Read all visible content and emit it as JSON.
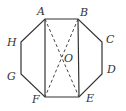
{
  "diagram": {
    "type": "geometry",
    "stroke_color": "#333333",
    "background": "#ffffff",
    "points": {
      "A": {
        "label": "A",
        "x": 45,
        "y": 19
      },
      "B": {
        "label": "B",
        "x": 78,
        "y": 19
      },
      "C": {
        "label": "C",
        "x": 102,
        "y": 42
      },
      "D": {
        "label": "D",
        "x": 102,
        "y": 74
      },
      "E": {
        "label": "E",
        "x": 79,
        "y": 97
      },
      "F": {
        "label": "F",
        "x": 45,
        "y": 97
      },
      "G": {
        "label": "G",
        "x": 21,
        "y": 74
      },
      "H": {
        "label": "H",
        "x": 21,
        "y": 42
      },
      "O": {
        "label": "O",
        "x": 62,
        "y": 58
      }
    },
    "octagon": [
      "A",
      "B",
      "C",
      "D",
      "E",
      "F",
      "G",
      "H"
    ],
    "solid_segments": [
      [
        "A",
        "F"
      ],
      [
        "B",
        "E"
      ]
    ],
    "dashed_segments": [
      [
        "A",
        "E"
      ],
      [
        "B",
        "F"
      ]
    ]
  }
}
